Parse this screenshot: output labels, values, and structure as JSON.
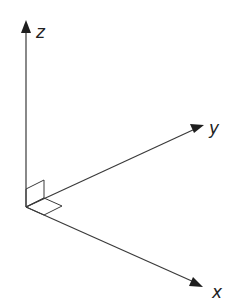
{
  "diagram": {
    "title": "",
    "type": "3d-axes",
    "origin": [
      26,
      207
    ],
    "axes": [
      {
        "name": "z",
        "label": "z",
        "tip": [
          26,
          22
        ],
        "label_pos": [
          36,
          38
        ]
      },
      {
        "name": "y",
        "label": "y",
        "tip": [
          203,
          125
        ],
        "label_pos": [
          209,
          134
        ]
      },
      {
        "name": "x",
        "label": "x",
        "tip": [
          202,
          286
        ],
        "label_pos": [
          212,
          298
        ]
      }
    ],
    "right_angle_marker": {
      "xy_plane": [
        [
          26,
          207
        ],
        [
          44,
          198
        ],
        [
          62,
          206
        ],
        [
          44,
          215
        ]
      ],
      "yz_plane": [
        [
          26,
          207
        ],
        [
          26,
          189
        ],
        [
          44,
          180
        ],
        [
          44,
          198
        ]
      ]
    },
    "colors": {
      "line": "#3a3a3a",
      "arrowhead": "#1e1e1e",
      "label": "#222222",
      "background": "#ffffff"
    }
  }
}
